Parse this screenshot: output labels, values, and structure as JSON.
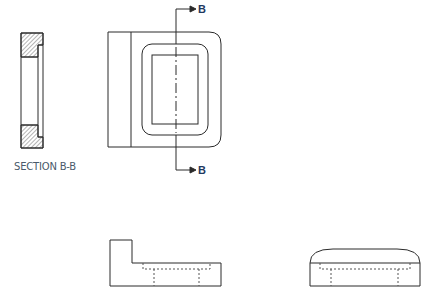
{
  "section_view": {
    "label": "SECTION B-B"
  },
  "cutting_plane": {
    "top_label": "B",
    "bottom_label": "B"
  },
  "colors": {
    "line": "#2a2a2a",
    "hidden_line": "#555555",
    "hatch": "#444444",
    "label_b": "#1f3a5f",
    "section_label": "#4a5a6a"
  },
  "views": [
    "section-b-b",
    "front-view",
    "bottom-left-view",
    "bottom-right-view"
  ]
}
